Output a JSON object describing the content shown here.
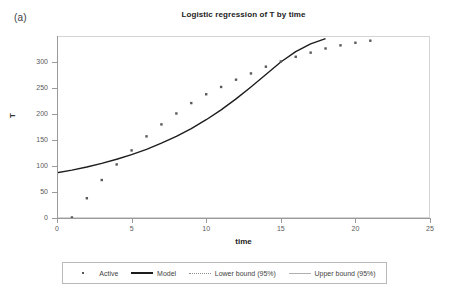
{
  "panel": {
    "label": "(a)"
  },
  "chart_data": {
    "type": "scatter",
    "title": "Logistic regression of T by time",
    "xlabel": "time",
    "ylabel": "T",
    "xlim": [
      0,
      25
    ],
    "ylim": [
      0,
      350
    ],
    "xticks": [
      0,
      5,
      10,
      15,
      20,
      25
    ],
    "yticks": [
      0,
      50,
      100,
      150,
      200,
      250,
      300
    ],
    "grid": false,
    "legend_position": "bottom",
    "series": [
      {
        "name": "Active",
        "type": "scatter",
        "marker": "square",
        "color": "#595959",
        "x": [
          1,
          2,
          3,
          4,
          5,
          6,
          7,
          8,
          9,
          10,
          11,
          12,
          13,
          14,
          15,
          16,
          17,
          18,
          19,
          20,
          21
        ],
        "values": [
          1,
          38,
          73,
          103,
          130,
          157,
          180,
          201,
          221,
          238,
          252,
          266,
          278,
          291,
          301,
          310,
          318,
          326,
          332,
          337,
          341
        ]
      },
      {
        "name": "Model",
        "type": "line",
        "style": "solid-thick",
        "color": "#1c1c1c",
        "x": [
          0,
          1,
          2,
          3,
          4,
          5,
          6,
          7,
          8,
          9,
          10,
          11,
          12,
          13,
          14,
          15,
          16,
          17,
          18
        ],
        "values": [
          87,
          92,
          98,
          105,
          113,
          122,
          132,
          144,
          157,
          172,
          189,
          208,
          229,
          252,
          276,
          300,
          320,
          335,
          345
        ]
      },
      {
        "name": "Lower bound (95%)",
        "type": "line",
        "style": "dotted",
        "color": "#8f8f8f",
        "x": [],
        "values": []
      },
      {
        "name": "Upper bound (95%)",
        "type": "line",
        "style": "solid-thin",
        "color": "#b0b0b0",
        "x": [],
        "values": []
      }
    ]
  }
}
